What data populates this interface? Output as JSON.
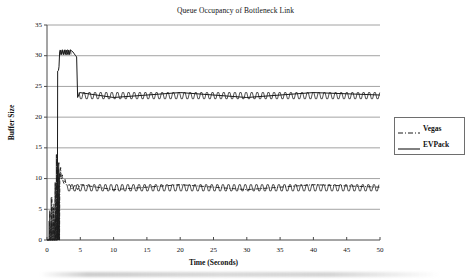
{
  "chart_data": {
    "type": "line",
    "title": "Queue Occupancy of Bottleneck Link",
    "xlabel": "Time (Seconds)",
    "ylabel": "Buffer Size",
    "xlim": [
      0,
      50
    ],
    "ylim": [
      0,
      35
    ],
    "xticks": [
      0,
      5,
      10,
      15,
      20,
      25,
      30,
      35,
      40,
      45,
      50
    ],
    "yticks": [
      0,
      5,
      10,
      15,
      20,
      25,
      30,
      35
    ],
    "grid": "horizontal",
    "legend_position": "right",
    "series": [
      {
        "name": "Vegas",
        "style": "dash-dot",
        "color": "#1a1a1a",
        "description": "Short startup burst of spikes between 0 and 2 seconds reaching about 14, then a steady sawtooth oscillating between about 8 and 9 for the rest of the run.",
        "steady_state_low": 8,
        "steady_state_high": 9,
        "peak": 14,
        "points": [
          [
            0.0,
            0
          ],
          [
            0.35,
            0
          ],
          [
            0.45,
            4.6
          ],
          [
            0.5,
            0
          ],
          [
            0.6,
            0
          ],
          [
            0.72,
            7.0
          ],
          [
            0.78,
            0
          ],
          [
            0.9,
            0
          ],
          [
            1.0,
            5.2
          ],
          [
            1.06,
            0
          ],
          [
            1.15,
            0
          ],
          [
            1.25,
            9.3
          ],
          [
            1.3,
            0
          ],
          [
            1.38,
            0
          ],
          [
            1.45,
            13.9
          ],
          [
            1.5,
            0
          ],
          [
            1.56,
            0
          ],
          [
            1.62,
            11.4
          ],
          [
            1.66,
            0
          ],
          [
            1.72,
            0
          ],
          [
            1.78,
            12.6
          ],
          [
            1.82,
            0
          ],
          [
            1.88,
            0
          ],
          [
            1.93,
            11.0
          ],
          [
            1.97,
            10.2
          ],
          [
            2.05,
            11.8
          ],
          [
            2.12,
            10.4
          ],
          [
            2.2,
            9.9
          ],
          [
            2.3,
            10.6
          ],
          [
            2.4,
            9.6
          ],
          [
            2.55,
            9.2
          ],
          [
            2.7,
            9.9
          ],
          [
            2.85,
            9.1
          ],
          [
            3.0,
            8.9
          ],
          [
            3.4,
            9.0
          ],
          [
            3.8,
            8.2
          ],
          [
            4.2,
            9.0
          ],
          [
            4.6,
            8.2
          ],
          [
            5.0,
            9.0
          ],
          [
            10.0,
            8.2
          ],
          [
            20.0,
            9.0
          ],
          [
            30.0,
            8.2
          ],
          [
            40.0,
            9.0
          ],
          [
            50.0,
            8.6
          ]
        ]
      },
      {
        "name": "EVPack",
        "style": "solid",
        "color": "#1a1a1a",
        "description": "Flat near zero until about 1.6 seconds, a vertical rise to roughly 27.5, a high plateau sawtooth around 30 to 31 until about 4.5 seconds, then a sharp drop to a steady sawtooth between about 23 and 24.",
        "steady_state_low": 23,
        "steady_state_high": 24,
        "peak": 31,
        "points": [
          [
            0.0,
            0
          ],
          [
            1.55,
            0
          ],
          [
            1.6,
            27.5
          ],
          [
            1.72,
            27.6
          ],
          [
            1.8,
            28.2
          ],
          [
            1.9,
            30.6
          ],
          [
            2.0,
            30.9
          ],
          [
            2.15,
            30.2
          ],
          [
            2.3,
            30.9
          ],
          [
            2.45,
            30.2
          ],
          [
            2.6,
            30.9
          ],
          [
            2.75,
            30.2
          ],
          [
            2.9,
            30.9
          ],
          [
            3.05,
            30.2
          ],
          [
            3.2,
            30.9
          ],
          [
            3.35,
            30.2
          ],
          [
            3.5,
            30.9
          ],
          [
            3.7,
            30.8
          ],
          [
            3.9,
            30.6
          ],
          [
            4.1,
            30.3
          ],
          [
            4.3,
            30.0
          ],
          [
            4.45,
            29.8
          ],
          [
            4.6,
            23.2
          ],
          [
            4.9,
            24.0
          ],
          [
            10.0,
            23.2
          ],
          [
            20.0,
            24.0
          ],
          [
            30.0,
            23.2
          ],
          [
            40.0,
            24.0
          ],
          [
            50.0,
            23.6
          ]
        ]
      }
    ]
  },
  "legend": {
    "items": [
      {
        "label": "Vegas"
      },
      {
        "label": "EVPack"
      }
    ]
  },
  "axes": {
    "y_tick_labels": [
      "0",
      "5",
      "10",
      "15",
      "20",
      "25",
      "30",
      "35"
    ],
    "x_tick_labels": [
      "0",
      "5",
      "10",
      "15",
      "20",
      "25",
      "30",
      "35",
      "40",
      "45",
      "50"
    ]
  }
}
